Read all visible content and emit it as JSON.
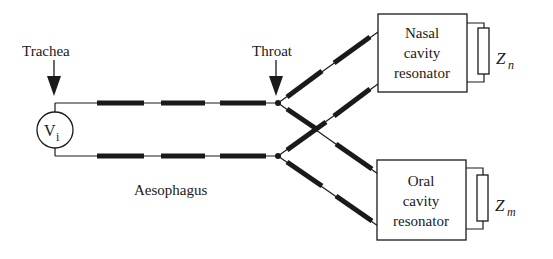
{
  "labels": {
    "trachea": "Trachea",
    "throat": "Throat",
    "source": "V",
    "source_sub": "i",
    "aesophagus": "Aesophagus"
  },
  "nasal": {
    "line1": "Nasal",
    "line2": "cavity",
    "line3": "resonator",
    "impedance": "Z",
    "impedance_sub": "n"
  },
  "oral": {
    "line1": "Oral",
    "line2": "cavity",
    "line3": "resonator",
    "impedance": "Z",
    "impedance_sub": "m"
  },
  "colors": {
    "ink": "#1a1a1a",
    "background": "#ffffff"
  }
}
